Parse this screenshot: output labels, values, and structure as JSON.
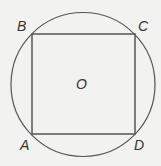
{
  "diagram": {
    "labels": {
      "A": "A",
      "B": "B",
      "C": "C",
      "D": "D",
      "O": "O"
    },
    "circle": {
      "cx": 83,
      "cy": 84.5,
      "r": 72
    },
    "square": {
      "x": 32,
      "y": 34,
      "w": 103,
      "h": 100
    },
    "colors": {
      "stroke": "#555555",
      "background": "#f2f2f0"
    }
  }
}
